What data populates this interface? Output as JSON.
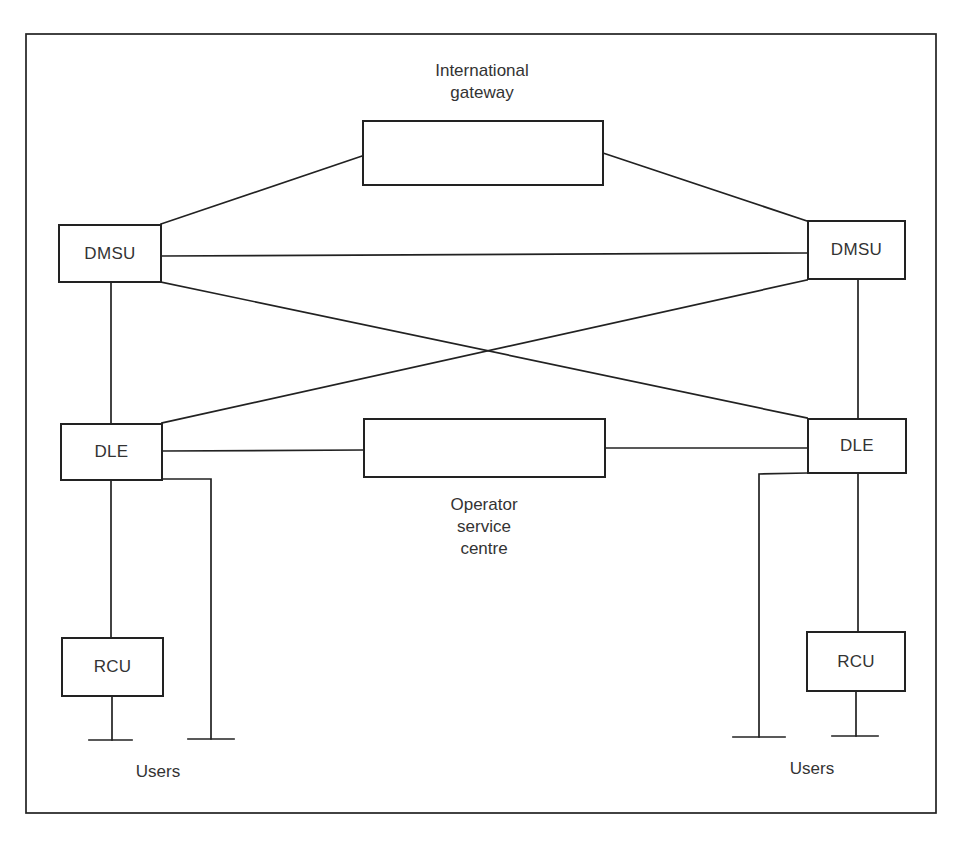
{
  "diagram": {
    "nodes": {
      "international_gateway": {
        "label": "",
        "caption": "International\ngateway"
      },
      "dmsu_left": {
        "label": "DMSU"
      },
      "dmsu_right": {
        "label": "DMSU"
      },
      "dle_left": {
        "label": "DLE"
      },
      "dle_right": {
        "label": "DLE"
      },
      "operator_service_centre": {
        "label": "",
        "caption": "Operator\nservice\ncentre"
      },
      "rcu_left": {
        "label": "RCU"
      },
      "rcu_right": {
        "label": "RCU"
      }
    },
    "users_left": {
      "label": "Users"
    },
    "users_right": {
      "label": "Users"
    },
    "edges": [
      [
        "dmsu_left",
        "international_gateway"
      ],
      [
        "dmsu_right",
        "international_gateway"
      ],
      [
        "dmsu_left",
        "dmsu_right"
      ],
      [
        "dmsu_left",
        "dle_right"
      ],
      [
        "dmsu_right",
        "dle_left"
      ],
      [
        "dmsu_left",
        "dle_left"
      ],
      [
        "dmsu_right",
        "dle_right"
      ],
      [
        "dle_left",
        "operator_service_centre"
      ],
      [
        "dle_right",
        "operator_service_centre"
      ],
      [
        "dle_left",
        "rcu_left"
      ],
      [
        "dle_right",
        "rcu_right"
      ],
      [
        "rcu_left",
        "users_left"
      ],
      [
        "dle_left",
        "users_left"
      ],
      [
        "rcu_right",
        "users_right"
      ],
      [
        "dle_right",
        "users_right"
      ]
    ]
  }
}
